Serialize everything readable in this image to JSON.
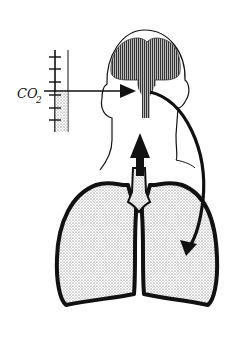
{
  "diagram": {
    "title": "",
    "labels": {
      "co2_main": "CO",
      "co2_subscript": "2"
    },
    "elements": [
      "co2-level-gauge",
      "head-outline",
      "brain",
      "brainstem",
      "lungs",
      "trachea",
      "arrow-lungs-to-brain",
      "arrow-brain-to-lungs",
      "co2-signal-arrow"
    ],
    "colors": {
      "ink": "#111111",
      "brain_fill": "#8a8a8a",
      "stipple": "#d8d8d8",
      "background": "#ffffff"
    }
  }
}
